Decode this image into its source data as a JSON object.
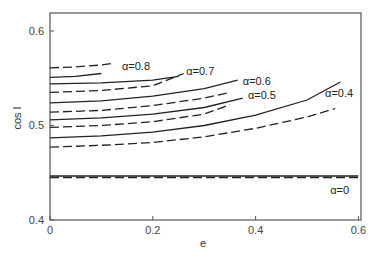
{
  "chart_data": {
    "type": "line",
    "title": "",
    "xlabel": "e",
    "ylabel": "cos I",
    "xlim": [
      0,
      0.605
    ],
    "ylim": [
      0.4,
      0.619
    ],
    "grid": false,
    "legend": "none (inline annotations)",
    "x_ticks": [
      0,
      0.2,
      0.4,
      0.6
    ],
    "x_tick_labels": [
      "0",
      "0.2",
      "0.4",
      "0.6"
    ],
    "y_ticks": [
      0.4,
      0.5,
      0.6
    ],
    "y_tick_labels": [
      "0.4",
      "0.5",
      "0.6"
    ],
    "series": [
      {
        "name": "α=0.8 (dashed)",
        "alpha": 0.8,
        "style": "dashed",
        "x": [
          0,
          0.05,
          0.1,
          0.125
        ],
        "y": [
          0.561,
          0.562,
          0.564,
          0.566
        ]
      },
      {
        "name": "α=0.8 (solid)",
        "alpha": 0.8,
        "style": "solid",
        "x": [
          0,
          0.05,
          0.1
        ],
        "y": [
          0.551,
          0.552,
          0.555
        ]
      },
      {
        "name": "α=0.7 (solid)",
        "alpha": 0.7,
        "style": "solid",
        "x": [
          0,
          0.1,
          0.2,
          0.25
        ],
        "y": [
          0.544,
          0.545,
          0.548,
          0.552
        ]
      },
      {
        "name": "α=0.7 (dashed)",
        "alpha": 0.7,
        "style": "dashed",
        "x": [
          0,
          0.1,
          0.2,
          0.26
        ],
        "y": [
          0.535,
          0.537,
          0.542,
          0.555
        ]
      },
      {
        "name": "α=0.6 (solid)",
        "alpha": 0.6,
        "style": "solid",
        "x": [
          0,
          0.1,
          0.2,
          0.3,
          0.365
        ],
        "y": [
          0.524,
          0.526,
          0.531,
          0.539,
          0.548
        ]
      },
      {
        "name": "α=0.6 (dashed)",
        "alpha": 0.6,
        "style": "dashed",
        "x": [
          0,
          0.1,
          0.2,
          0.3,
          0.35
        ],
        "y": [
          0.514,
          0.516,
          0.521,
          0.529,
          0.535
        ]
      },
      {
        "name": "α=0.5 (solid)",
        "alpha": 0.5,
        "style": "solid",
        "x": [
          0,
          0.1,
          0.2,
          0.3,
          0.375
        ],
        "y": [
          0.506,
          0.508,
          0.512,
          0.519,
          0.529
        ]
      },
      {
        "name": "α=0.5 (dashed)",
        "alpha": 0.5,
        "style": "dashed",
        "x": [
          0,
          0.1,
          0.2,
          0.3,
          0.35
        ],
        "y": [
          0.498,
          0.5,
          0.504,
          0.512,
          0.522
        ]
      },
      {
        "name": "α=0.4 (solid)",
        "alpha": 0.4,
        "style": "solid",
        "x": [
          0,
          0.1,
          0.2,
          0.3,
          0.4,
          0.5,
          0.565
        ],
        "y": [
          0.487,
          0.489,
          0.493,
          0.5,
          0.511,
          0.527,
          0.546
        ]
      },
      {
        "name": "α=0.4 (dashed)",
        "alpha": 0.4,
        "style": "dashed",
        "x": [
          0,
          0.1,
          0.2,
          0.3,
          0.4,
          0.5,
          0.555
        ],
        "y": [
          0.477,
          0.479,
          0.482,
          0.488,
          0.497,
          0.509,
          0.518
        ]
      },
      {
        "name": "α=0 (solid)",
        "alpha": 0,
        "style": "solid",
        "x": [
          0,
          0.6
        ],
        "y": [
          0.4466,
          0.4466
        ]
      },
      {
        "name": "α=0 (dashed)",
        "alpha": 0,
        "style": "dashed",
        "x": [
          0,
          0.6
        ],
        "y": [
          0.445,
          0.445
        ]
      }
    ],
    "annotations": [
      {
        "text": "α=0.8",
        "e": 0.14,
        "cosI": 0.563
      },
      {
        "text": "α=0.7",
        "e": 0.265,
        "cosI": 0.558
      },
      {
        "text": "α=0.6",
        "e": 0.375,
        "cosI": 0.547
      },
      {
        "text": "α=0.5",
        "e": 0.385,
        "cosI": 0.532
      },
      {
        "text": "α=0.4",
        "e": 0.535,
        "cosI": 0.534
      },
      {
        "text": "α=0",
        "e": 0.545,
        "cosI": 0.432
      }
    ]
  }
}
